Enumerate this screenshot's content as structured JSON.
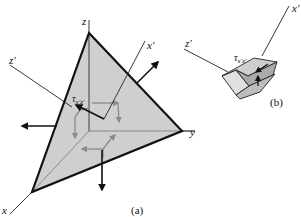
{
  "figure": {
    "part_a": {
      "caption": "(a)",
      "axes": {
        "x": "x",
        "y": "y",
        "z": "z",
        "x_prime": "x'",
        "z_prime": "z'"
      },
      "stress_label": {
        "symbol": "τ",
        "subscript": "x'z'"
      }
    },
    "part_b": {
      "caption": "(b)",
      "axes": {
        "x_prime": "x'",
        "z_prime": "z'"
      },
      "stress_label": {
        "symbol": "τ",
        "subscript": "x'z'"
      }
    }
  },
  "colors": {
    "plane_fill": "#cfcfcf",
    "edge": "#111111",
    "inner_lines": "#8a8a8a",
    "block_light": "#e0e0e0",
    "block_mid": "#bdbdbd",
    "block_dark": "#9a9a9a"
  }
}
